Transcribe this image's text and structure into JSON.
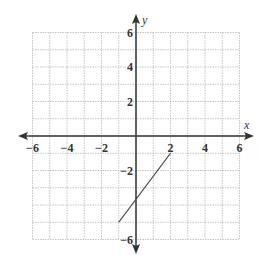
{
  "chart_data": {
    "type": "line",
    "title": "",
    "xlabel": "x",
    "ylabel": "y",
    "xlim": [
      -6,
      6
    ],
    "ylim": [
      -6,
      6
    ],
    "grid": true,
    "grid_step": 1,
    "x_ticks": [
      -6,
      -4,
      -2,
      2,
      4,
      6
    ],
    "y_ticks": [
      6,
      4,
      2,
      -2,
      -6
    ],
    "x_tick_labels": [
      "−6",
      "−4",
      "−2",
      "2",
      "4",
      "6"
    ],
    "y_tick_labels": [
      "6",
      "4",
      "2",
      "−2",
      "−6"
    ],
    "series": [
      {
        "name": "segment",
        "points": [
          [
            -1,
            -5
          ],
          [
            2,
            -1
          ]
        ]
      }
    ],
    "colors": {
      "grid": "#b8b8b8",
      "axis": "#333333",
      "line": "#444444"
    }
  },
  "labels": {
    "x_axis": "x",
    "y_axis": "y"
  }
}
